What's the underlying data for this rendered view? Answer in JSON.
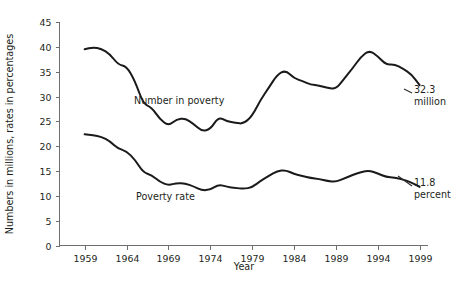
{
  "chart_data": {
    "type": "line",
    "title": "",
    "xlabel": "Year",
    "ylabel": "Numbers in millions, rates in percentages",
    "xlim": [
      1956,
      2000
    ],
    "ylim": [
      0,
      45
    ],
    "grid": false,
    "legend": "inline-labels",
    "x_ticks": [
      1959,
      1964,
      1969,
      1974,
      1979,
      1984,
      1989,
      1994,
      1999
    ],
    "y_ticks": [
      0,
      5,
      10,
      15,
      20,
      25,
      30,
      35,
      40,
      45
    ],
    "x": [
      1959,
      1960,
      1961,
      1962,
      1963,
      1964,
      1965,
      1966,
      1967,
      1968,
      1969,
      1970,
      1971,
      1972,
      1973,
      1974,
      1975,
      1976,
      1977,
      1978,
      1979,
      1980,
      1981,
      1982,
      1983,
      1984,
      1985,
      1986,
      1987,
      1988,
      1989,
      1990,
      1991,
      1992,
      1993,
      1994,
      1995,
      1996,
      1997,
      1998,
      1999
    ],
    "series": [
      {
        "name": "Number in poverty",
        "label": "Number in poverty",
        "units": "millions",
        "endpoint_value": "32.3",
        "endpoint_unit": "million",
        "values": [
          39.5,
          39.9,
          39.6,
          38.6,
          36.4,
          36.1,
          33.2,
          28.5,
          27.8,
          25.4,
          24.1,
          25.4,
          25.6,
          24.5,
          23.0,
          23.4,
          25.9,
          25.0,
          24.7,
          24.5,
          26.1,
          29.3,
          31.8,
          34.4,
          35.3,
          33.7,
          33.1,
          32.4,
          32.2,
          31.7,
          31.5,
          33.6,
          35.7,
          38.0,
          39.3,
          38.1,
          36.4,
          36.5,
          35.6,
          34.5,
          32.3
        ]
      },
      {
        "name": "Poverty rate",
        "label": "Poverty rate",
        "units": "percent",
        "endpoint_value": "11.8",
        "endpoint_unit": "percent",
        "values": [
          22.4,
          22.2,
          21.9,
          21.0,
          19.5,
          19.0,
          17.3,
          14.7,
          14.2,
          12.8,
          12.1,
          12.6,
          12.5,
          11.9,
          11.1,
          11.2,
          12.3,
          11.8,
          11.6,
          11.4,
          11.7,
          13.0,
          14.0,
          15.0,
          15.2,
          14.4,
          14.0,
          13.6,
          13.4,
          13.0,
          12.8,
          13.5,
          14.2,
          14.8,
          15.1,
          14.5,
          13.8,
          13.7,
          13.3,
          12.7,
          11.8
        ]
      }
    ],
    "annotations": [
      {
        "name": "number-in-poverty-endpoint",
        "text_value": "32.3",
        "text_unit": "million"
      },
      {
        "name": "poverty-rate-endpoint",
        "text_value": "11.8",
        "text_unit": "percent"
      }
    ],
    "colors": {
      "line": "#1a1a1a",
      "axis": "#6d6e70",
      "text": "#231f20",
      "background": "#ffffff"
    }
  }
}
